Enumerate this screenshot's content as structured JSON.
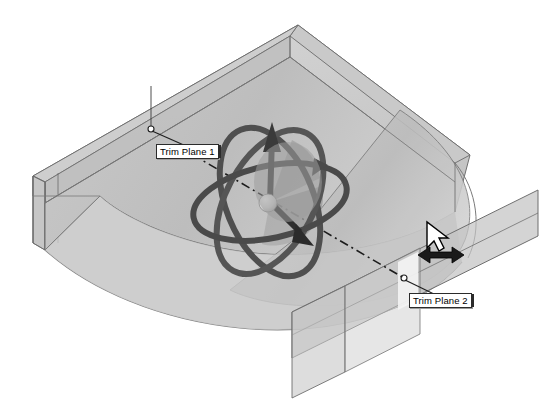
{
  "app": {
    "view_type": "3d-model-viewport",
    "background_color": "#ffffff"
  },
  "model": {
    "name": "trimmed-solid-body",
    "body_fill": "#c4c4c4",
    "body_fill_light": "#d4d4d4",
    "body_fill_dark": "#b0b0b0",
    "edge_color": "#6e6e6e",
    "description": "Translucent extruded solid with curved bottom face"
  },
  "trim_planes": [
    {
      "id": "trim-plane-1",
      "label": "Trim Plane 1",
      "anchor_x": 151,
      "anchor_y": 129,
      "label_x": 156,
      "label_y": 144,
      "fill": "#bdbdbd"
    },
    {
      "id": "trim-plane-2",
      "label": "Trim Plane 2",
      "anchor_x": 404,
      "anchor_y": 278,
      "label_x": 409,
      "label_y": 293,
      "fill": "#c0c0c0"
    }
  ],
  "manipulator": {
    "name": "triad-rotation-manipulator",
    "center_x": 270,
    "center_y": 202,
    "ring_color": "#4f4f4f",
    "ring_count": 3,
    "sphere_color": "#d8d8d8",
    "arrow_color": "#3a3a3a",
    "axis_line_style": "dash-dot",
    "axis_color": "#222222",
    "arrows": [
      {
        "name": "up-arrow",
        "direction": "up"
      },
      {
        "name": "right-down-arrow",
        "direction": "right-down"
      },
      {
        "name": "right-up-arrow",
        "direction": "right-up"
      }
    ]
  },
  "cursor": {
    "name": "drag-horizontal-cursor",
    "pointer_x": 429,
    "pointer_y": 228,
    "arrow_x": 437,
    "arrow_y": 255,
    "pointer_fill": "#ffffff",
    "pointer_stroke": "#000000",
    "drag_arrow_fill": "#1a1a1a"
  }
}
